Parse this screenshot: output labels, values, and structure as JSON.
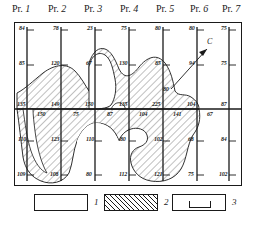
{
  "figure": {
    "profile_headers": [
      {
        "prefix": "Pr.",
        "number": "1"
      },
      {
        "prefix": "Pr.",
        "number": "2"
      },
      {
        "prefix": "Pr.",
        "number": "3"
      },
      {
        "prefix": "Pr.",
        "number": "4"
      },
      {
        "prefix": "Pr.",
        "number": "5"
      },
      {
        "prefix": "Pr.",
        "number": "6"
      },
      {
        "prefix": "Pr.",
        "number": "7"
      }
    ],
    "axis_marker_label": "C",
    "values": {
      "top_row": [
        "84",
        "78",
        "23",
        "75",
        "80",
        "80",
        "75"
      ],
      "upper_row": [
        "85",
        "120",
        "67",
        "130",
        "85",
        "94",
        "75"
      ],
      "axis_above": [
        "135",
        "149",
        "150",
        "135",
        "225",
        "104",
        "87"
      ],
      "axis_below": [
        "150",
        "75",
        "87",
        "104",
        "141",
        "67"
      ],
      "lower_row": [
        "110",
        "123",
        "110",
        "80",
        "102",
        "68",
        "84"
      ],
      "bottom_row": [
        "109",
        "108",
        "80",
        "112",
        "121",
        "75",
        "102"
      ],
      "c_marker": "80"
    }
  },
  "legend": {
    "items": [
      {
        "number": "1",
        "style": "empty",
        "name": "legend-empty-box"
      },
      {
        "number": "2",
        "style": "hatched",
        "name": "legend-hatched-box"
      },
      {
        "number": "3",
        "style": "ushape",
        "name": "legend-ushape-box"
      }
    ]
  },
  "colors": {
    "ink": "#1a1a1a",
    "paper": "#ffffff"
  }
}
